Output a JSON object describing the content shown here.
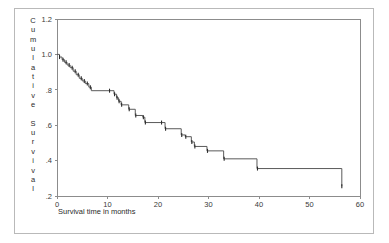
{
  "figure": {
    "background_color": "#ffffff",
    "frame_color": "#b9b9b9",
    "axis_color": "#8c8c8c",
    "curve_color": "#5a5a5a",
    "censor_color": "#2b2b2b"
  },
  "axes": {
    "y_title": "Cumulative Survival",
    "y_title_chars": [
      "C",
      "u",
      "m",
      "u",
      "l",
      "a",
      "t",
      "i",
      "v",
      "e",
      "",
      "S",
      "u",
      "r",
      "v",
      "i",
      "v",
      "a",
      "l"
    ],
    "x_title": "Survival time in months",
    "x_ticks": [
      "0",
      "10",
      "20",
      "30",
      "40",
      "50",
      "60"
    ],
    "y_ticks": [
      "1.2",
      "1.0",
      ".8",
      ".6",
      ".4",
      ".2"
    ]
  },
  "chart_data": {
    "type": "line",
    "title": "",
    "subtitle": "",
    "xlabel": "Survival time in months",
    "ylabel": "Cumulative Survival",
    "xlim": [
      0,
      60
    ],
    "ylim": [
      0.2,
      1.2
    ],
    "x_ticks": [
      0,
      10,
      20,
      30,
      40,
      50,
      60
    ],
    "y_ticks": [
      1.2,
      1.0,
      0.8,
      0.6,
      0.4,
      0.2
    ],
    "grid": false,
    "legend": null,
    "series": [
      {
        "name": "Kaplan-Meier cumulative survival",
        "style": "step-post",
        "x": [
          0.0,
          0.5,
          1.0,
          1.5,
          2.0,
          2.6,
          3.2,
          3.8,
          4.4,
          5.0,
          5.6,
          6.3,
          6.8,
          10.3,
          11.3,
          11.8,
          12.2,
          12.7,
          14.2,
          15.5,
          17.0,
          17.4,
          20.6,
          21.4,
          24.6,
          25.4,
          26.6,
          27.2,
          29.7,
          33.0,
          39.6,
          56.4
        ],
        "y": [
          1.0,
          0.985,
          0.97,
          0.955,
          0.94,
          0.925,
          0.905,
          0.885,
          0.865,
          0.85,
          0.835,
          0.815,
          0.795,
          0.795,
          0.775,
          0.755,
          0.735,
          0.715,
          0.69,
          0.655,
          0.645,
          0.615,
          0.615,
          0.58,
          0.545,
          0.535,
          0.505,
          0.48,
          0.455,
          0.41,
          0.355,
          0.255
        ]
      }
    ],
    "censored_points": {
      "x": [
        0.5,
        1.2,
        1.8,
        2.4,
        3.0,
        3.6,
        4.2,
        4.8,
        5.4,
        6.0,
        6.6,
        10.4,
        11.4,
        11.9,
        12.3,
        12.8,
        14.3,
        15.6,
        17.1,
        17.5,
        20.7,
        21.5,
        24.7,
        25.5,
        26.7,
        27.3,
        29.8,
        33.1,
        39.7,
        56.4
      ],
      "y": [
        0.985,
        0.97,
        0.955,
        0.94,
        0.925,
        0.905,
        0.885,
        0.865,
        0.85,
        0.835,
        0.815,
        0.795,
        0.775,
        0.755,
        0.735,
        0.715,
        0.69,
        0.655,
        0.645,
        0.615,
        0.615,
        0.58,
        0.545,
        0.535,
        0.505,
        0.48,
        0.455,
        0.41,
        0.355,
        0.255
      ]
    }
  }
}
